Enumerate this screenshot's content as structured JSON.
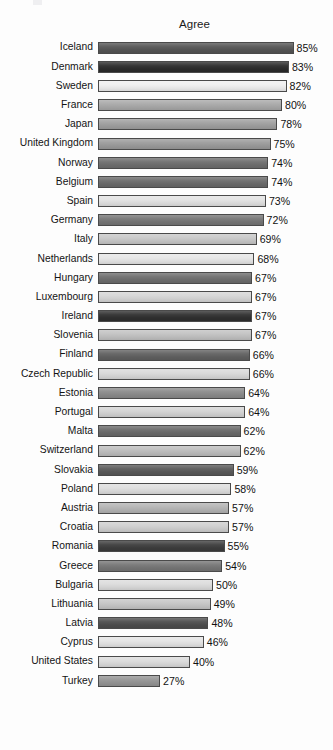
{
  "chart_data": {
    "type": "bar",
    "orientation": "horizontal",
    "title": "Agree",
    "xlabel": "",
    "ylabel": "",
    "xlim": [
      0,
      85
    ],
    "grid": false,
    "legend": null,
    "value_suffix": "%",
    "categories": [
      "Iceland",
      "Denmark",
      "Sweden",
      "France",
      "Japan",
      "United Kingdom",
      "Norway",
      "Belgium",
      "Spain",
      "Germany",
      "Italy",
      "Netherlands",
      "Hungary",
      "Luxembourg",
      "Ireland",
      "Slovenia",
      "Finland",
      "Czech Republic",
      "Estonia",
      "Portugal",
      "Malta",
      "Switzerland",
      "Slovakia",
      "Poland",
      "Austria",
      "Croatia",
      "Romania",
      "Greece",
      "Bulgaria",
      "Lithuania",
      "Latvia",
      "Cyprus",
      "United States",
      "Turkey"
    ],
    "values": [
      85,
      83,
      82,
      80,
      78,
      75,
      74,
      74,
      73,
      72,
      69,
      68,
      67,
      67,
      67,
      67,
      66,
      66,
      64,
      64,
      62,
      62,
      59,
      58,
      57,
      57,
      55,
      54,
      50,
      49,
      48,
      46,
      40,
      27
    ],
    "value_labels": [
      "85%",
      "83%",
      "82%",
      "80%",
      "78%",
      "75%",
      "74%",
      "74%",
      "73%",
      "72%",
      "69%",
      "68%",
      "67%",
      "67%",
      "67%",
      "67%",
      "66%",
      "66%",
      "64%",
      "64%",
      "62%",
      "62%",
      "59%",
      "58%",
      "57%",
      "57%",
      "55%",
      "54%",
      "50%",
      "49%",
      "48%",
      "46%",
      "40%",
      "27%"
    ],
    "bar_colors": [
      "#555555",
      "#2b2b2b",
      "#efefef",
      "#a9a9a9",
      "#a0a0a0",
      "#9b9b9b",
      "#6f6f6f",
      "#6b6b6b",
      "#e2e2e2",
      "#767676",
      "#c8c8c8",
      "#e6e6e6",
      "#6e6e6e",
      "#d6d6d6",
      "#2f2f2f",
      "#c2c2c2",
      "#616161",
      "#d9d9d9",
      "#8b8b8b",
      "#d4d4d4",
      "#6a6a6a",
      "#bdbdbd",
      "#5a5a5a",
      "#dedede",
      "#b4b4b4",
      "#cfcfcf",
      "#3d3d3d",
      "#767676",
      "#dcdcdc",
      "#c6c6c6",
      "#4e4e4e",
      "#e4e4e4",
      "#dbdbdb",
      "#959595"
    ],
    "bar_border_color": "#4a4a4a",
    "scale_px_per_percent": 2.3,
    "bar_origin_px": 102
  }
}
